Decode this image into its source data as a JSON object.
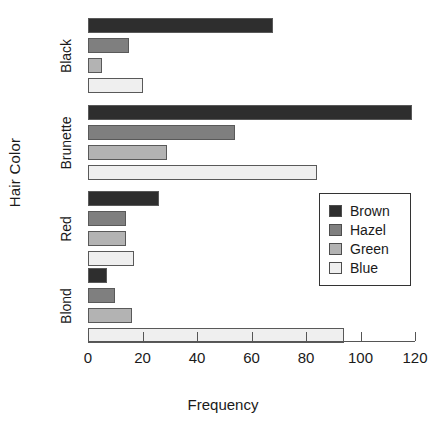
{
  "chart_data": {
    "type": "bar",
    "orientation": "horizontal",
    "grouped": true,
    "title": "",
    "xlabel": "Frequency",
    "ylabel": "Hair Color",
    "xlim": [
      0,
      120
    ],
    "xticks": [
      0,
      20,
      40,
      60,
      80,
      100,
      120
    ],
    "xtick_labels": [
      "0",
      "20",
      "40",
      "60",
      "80",
      "100",
      "120"
    ],
    "grid": false,
    "legend_position": "center-right",
    "categories": [
      "Blond",
      "Red",
      "Brunette",
      "Black"
    ],
    "categories_top_to_bottom": [
      "Black",
      "Brunette",
      "Red",
      "Blond"
    ],
    "series": [
      {
        "name": "Brown",
        "color": "#2e2e2e",
        "values": [
          7,
          26,
          119,
          68
        ]
      },
      {
        "name": "Hazel",
        "color": "#7f7f7f",
        "values": [
          10,
          14,
          54,
          15
        ]
      },
      {
        "name": "Green",
        "color": "#b3b3b3",
        "values": [
          16,
          14,
          29,
          5
        ]
      },
      {
        "name": "Blue",
        "color": "#efefef",
        "values": [
          94,
          17,
          84,
          20
        ]
      }
    ],
    "groups_top_to_bottom": [
      {
        "category": "Black",
        "bars": [
          {
            "series": "Brown",
            "value": 68
          },
          {
            "series": "Hazel",
            "value": 15
          },
          {
            "series": "Green",
            "value": 5
          },
          {
            "series": "Blue",
            "value": 20
          }
        ]
      },
      {
        "category": "Brunette",
        "bars": [
          {
            "series": "Brown",
            "value": 119
          },
          {
            "series": "Hazel",
            "value": 54
          },
          {
            "series": "Green",
            "value": 29
          },
          {
            "series": "Blue",
            "value": 84
          }
        ]
      },
      {
        "category": "Red",
        "bars": [
          {
            "series": "Brown",
            "value": 26
          },
          {
            "series": "Hazel",
            "value": 14
          },
          {
            "series": "Green",
            "value": 14
          },
          {
            "series": "Blue",
            "value": 17
          }
        ]
      },
      {
        "category": "Blond",
        "bars": [
          {
            "series": "Brown",
            "value": 7
          },
          {
            "series": "Hazel",
            "value": 10
          },
          {
            "series": "Green",
            "value": 16
          },
          {
            "series": "Blue",
            "value": 94
          }
        ]
      }
    ],
    "legend": {
      "entries": [
        {
          "label": "Brown",
          "color": "#2e2e2e"
        },
        {
          "label": "Hazel",
          "color": "#7f7f7f"
        },
        {
          "label": "Green",
          "color": "#b3b3b3"
        },
        {
          "label": "Blue",
          "color": "#efefef"
        }
      ]
    }
  },
  "axes": {
    "x_title": "Frequency",
    "y_title": "Hair Color"
  }
}
